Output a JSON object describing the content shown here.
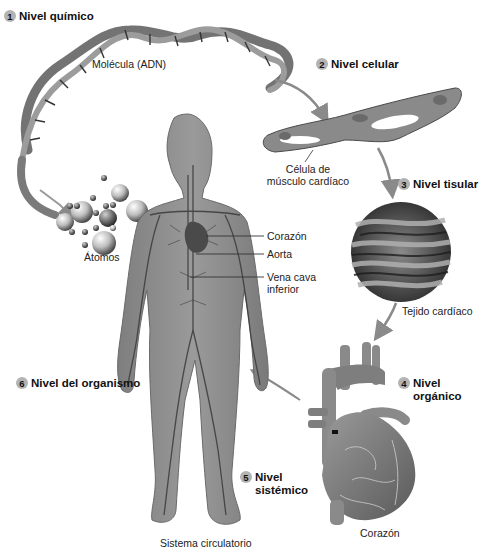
{
  "levels": [
    {
      "num": "1",
      "title": "Nivel químico"
    },
    {
      "num": "2",
      "title": "Nivel celular"
    },
    {
      "num": "3",
      "title": "Nivel tisular"
    },
    {
      "num": "4",
      "title": "Nivel orgánico"
    },
    {
      "num": "5",
      "title_line1": "Nivel",
      "title_line2": "sistémico"
    },
    {
      "num": "6",
      "title": "Nivel del organismo"
    }
  ],
  "labels": {
    "molecule": "Molécula (ADN)",
    "atoms": "Átomos",
    "cell_line1": "Célula de",
    "cell_line2": "músculo cardíaco",
    "tissue": "Tejido cardíaco",
    "organ": "Corazón",
    "system": "Sistema circulatorio",
    "callout_heart": "Corazón",
    "callout_aorta": "Aorta",
    "callout_vena_line1": "Vena cava",
    "callout_vena_line2": "inferior"
  },
  "colors": {
    "badge": "#b3b3b3",
    "body": "#8c8c8c",
    "vessels": "#3a3a3a",
    "arrow": "#8a8a8a"
  }
}
